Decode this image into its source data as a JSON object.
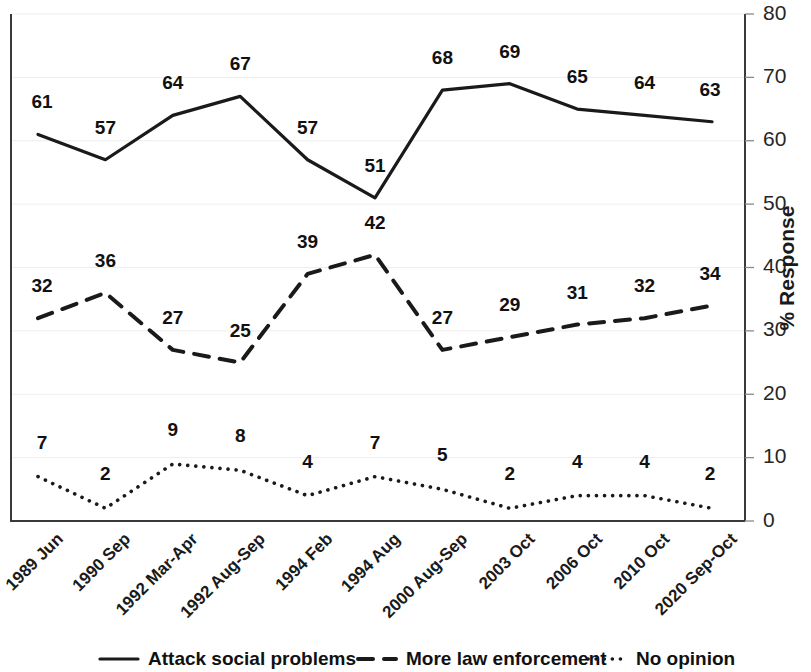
{
  "chart_data": {
    "type": "line",
    "title": "",
    "xlabel": "",
    "ylabel": "% Response",
    "ylim": [
      0,
      80
    ],
    "yticks": [
      0,
      10,
      20,
      30,
      40,
      50,
      60,
      70,
      80
    ],
    "grid": true,
    "legend_position": "bottom",
    "categories": [
      "1989 Jun",
      "1990 Sep",
      "1992 Mar-Apr",
      "1992 Aug-Sep",
      "1994 Feb",
      "1994 Aug",
      "2000 Aug-Sep",
      "2003 Oct",
      "2006 Oct",
      "2010 Oct",
      "2020 Sep-Oct"
    ],
    "series": [
      {
        "name": "Attack social problems",
        "style": "solid",
        "values": [
          61,
          57,
          64,
          67,
          57,
          51,
          68,
          69,
          65,
          64,
          63
        ]
      },
      {
        "name": "More law enforcement",
        "style": "dashed",
        "values": [
          32,
          36,
          27,
          25,
          39,
          42,
          27,
          29,
          31,
          32,
          34
        ]
      },
      {
        "name": "No opinion",
        "style": "dotted",
        "values": [
          7,
          2,
          9,
          8,
          4,
          7,
          5,
          2,
          4,
          4,
          2
        ]
      }
    ]
  },
  "colors": {
    "ink": "#1a1a1a",
    "grid": "#ededed",
    "axis": "#3a3a3a",
    "background": "#ffffff"
  }
}
